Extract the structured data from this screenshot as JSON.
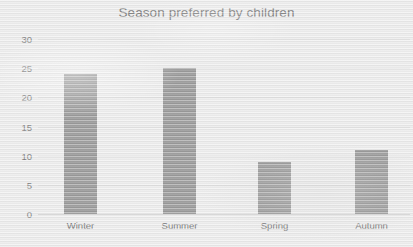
{
  "chart_data": {
    "type": "bar",
    "title": "Season preferred by children",
    "xlabel": "",
    "ylabel": "",
    "categories": [
      "Winter",
      "Summer",
      "Spring",
      "Autumn"
    ],
    "values": [
      24,
      25,
      9,
      11
    ],
    "series": [
      {
        "name": "Season preferred by children",
        "values": [
          24,
          25,
          9,
          11
        ]
      }
    ],
    "ylim": [
      0,
      30
    ],
    "y_ticks": [
      0,
      5,
      10,
      15,
      20,
      25,
      30
    ],
    "y_tick_labels": [
      "0",
      "5",
      "10",
      "15",
      "20",
      "25",
      "30"
    ],
    "grid": true,
    "grid_axis": "y",
    "legend": false,
    "legend_position": "none",
    "annotations": [],
    "colors": {
      "bar_fill": "#808080",
      "background": "#eaeaea",
      "title_text": "#5a5a5a",
      "axis_text": "#5f5f5f",
      "gridline": "#dcdcdc",
      "baseline": "#c9c9c9"
    }
  }
}
